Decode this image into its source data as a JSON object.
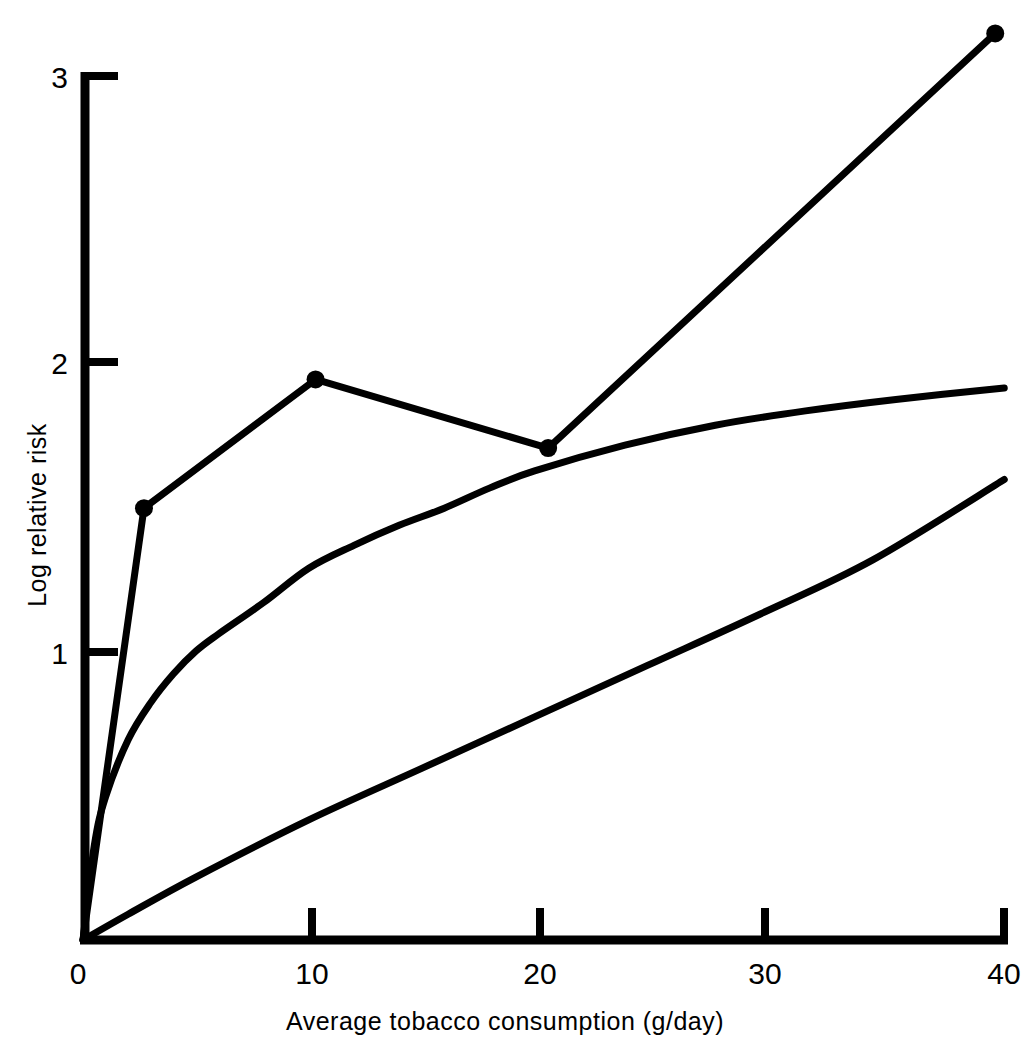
{
  "chart_data": {
    "type": "line",
    "title": "",
    "xlabel": "Average tobacco consumption (g/day)",
    "ylabel": "Log relative risk",
    "xlim": [
      0,
      41
    ],
    "ylim": [
      0,
      3.3
    ],
    "xticks": [
      0,
      10,
      20,
      30,
      40
    ],
    "xtick_labels": [
      "0",
      "10",
      "20",
      "30",
      "40"
    ],
    "yticks": [
      0,
      1,
      2,
      3
    ],
    "ytick_labels": [
      "0",
      "1",
      "2",
      "3"
    ],
    "grid": false,
    "legend": "none",
    "axis_style": "left-and-bottom-spines-only",
    "line_color": "#000000",
    "background_color": "#ffffff",
    "series": [
      {
        "name": "observed-data-with-markers",
        "marker": "filled-circle",
        "marker_size": 9,
        "x": [
          0,
          2.7,
          10.3,
          20.6,
          40.4
        ],
        "y": [
          0,
          1.51,
          1.96,
          1.72,
          3.17
        ],
        "marker_x": [
          2.7,
          10.3,
          20.6,
          40.4
        ],
        "marker_y": [
          1.51,
          1.96,
          1.72,
          3.17
        ]
      },
      {
        "name": "upper-fitted-curve",
        "marker": "none",
        "x": [
          0,
          0.5,
          1,
          2,
          3,
          4,
          5,
          6,
          8,
          10,
          12,
          14,
          16,
          18,
          20,
          24,
          28,
          32,
          36,
          40.8
        ],
        "y": [
          0,
          0.33,
          0.5,
          0.7,
          0.83,
          0.93,
          1.01,
          1.07,
          1.18,
          1.3,
          1.38,
          1.45,
          1.51,
          1.58,
          1.64,
          1.73,
          1.8,
          1.85,
          1.89,
          1.93
        ]
      },
      {
        "name": "lower-fitted-curve",
        "marker": "none",
        "x": [
          0,
          2,
          5,
          10,
          15,
          20,
          25,
          30,
          35,
          40.8
        ],
        "y": [
          0,
          0.09,
          0.22,
          0.42,
          0.6,
          0.78,
          0.96,
          1.14,
          1.33,
          1.61
        ]
      }
    ]
  },
  "axes": {
    "x_label": "Average tobacco consumption (g/day)",
    "y_label": "Log relative risk",
    "x_tick_0": "0",
    "x_tick_10": "10",
    "x_tick_20": "20",
    "x_tick_30": "30",
    "x_tick_40": "40",
    "y_tick_0": "0",
    "y_tick_1": "1",
    "y_tick_2": "2",
    "y_tick_3": "3"
  }
}
